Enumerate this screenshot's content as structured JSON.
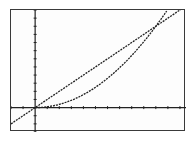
{
  "calculator": {
    "screen": "graph"
  },
  "colors": {
    "background": "#ffffff",
    "ink": "#222222",
    "border": "#3a3a3a"
  },
  "chart_data": {
    "type": "line",
    "title": "",
    "xlabel": "",
    "ylabel": "",
    "grid": false,
    "legend": null,
    "xlim": [
      -2,
      12.5
    ],
    "ylim": [
      -3,
      12
    ],
    "x_tick_step": 1,
    "y_tick_step": 1,
    "series": [
      {
        "name": "line",
        "expression": "y = x",
        "x": [
          -2,
          0,
          2,
          4,
          6,
          8,
          10,
          12.5
        ],
        "y": [
          -2,
          0,
          2,
          4,
          6,
          8,
          10,
          12.5
        ]
      },
      {
        "name": "parabola",
        "expression": "y = x^2/10",
        "x": [
          0,
          2,
          4,
          6,
          8,
          10,
          11
        ],
        "y": [
          0,
          0.4,
          1.6,
          3.6,
          6.4,
          10,
          12.1
        ]
      }
    ],
    "intersections": [
      [
        0,
        0
      ],
      [
        10,
        10
      ]
    ]
  }
}
